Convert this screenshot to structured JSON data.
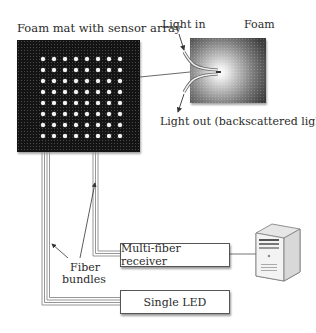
{
  "diagram": {
    "mat_title": "Foam mat with sensor array",
    "sensor_grid": {
      "rows": 8,
      "cols": 8
    },
    "inset": {
      "light_in_label": "Light in",
      "foam_label": "Foam",
      "light_out_label": "Light out (backscattered light)"
    },
    "fiber_label_line1": "Fiber",
    "fiber_label_line2": "bundles",
    "receiver_label": "Multi-fiber receiver",
    "led_label": "Single LED",
    "computer_icon": "server-tower-icon",
    "colors": {
      "mat": "#141414",
      "dot": "#f4f4f4",
      "fiber": "#8a8a8a",
      "box_border": "#555555"
    }
  }
}
